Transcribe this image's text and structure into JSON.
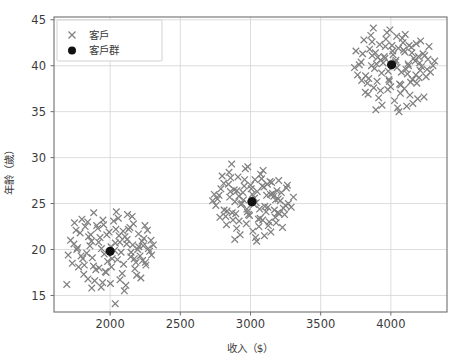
{
  "figure": {
    "background_color": "#ffffff",
    "plot_background_color": "#ffffff",
    "width": 459,
    "height": 364
  },
  "chart_data": {
    "type": "scatter",
    "title": "",
    "xlabel": "收入（$）",
    "ylabel": "年齡（歲）",
    "xlim": [
      1600,
      4400
    ],
    "ylim": [
      13.2,
      45.3
    ],
    "xticks": [
      2000,
      2500,
      3000,
      3500,
      4000
    ],
    "yticks": [
      15,
      20,
      25,
      30,
      35,
      40,
      45
    ],
    "xtick_labels": [
      "2000",
      "2500",
      "3000",
      "3500",
      "4000"
    ],
    "ytick_labels": [
      "15",
      "20",
      "25",
      "30",
      "35",
      "40",
      "45"
    ],
    "grid": true,
    "grid_color": "#d4d4d4",
    "legend_position": "upper left",
    "legend": [
      {
        "label": "客戶",
        "marker": "x",
        "color": "#808080"
      },
      {
        "label": "客戶群",
        "marker": "o",
        "color": "#111111"
      }
    ],
    "series": [
      {
        "name": "客戶",
        "marker": "x",
        "color": "#808080",
        "points": [
          [
            1742,
            20.6
          ],
          [
            1793,
            19.3
          ],
          [
            1846,
            21.4
          ],
          [
            1881,
            18.2
          ],
          [
            1904,
            22.6
          ],
          [
            1938,
            20.1
          ],
          [
            1966,
            17.6
          ],
          [
            1993,
            21.9
          ],
          [
            2014,
            19.0
          ],
          [
            2041,
            22.2
          ],
          [
            2069,
            20.8
          ],
          [
            2096,
            18.4
          ],
          [
            2121,
            21.1
          ],
          [
            2149,
            19.7
          ],
          [
            2176,
            17.9
          ],
          [
            2204,
            20.3
          ],
          [
            2231,
            18.8
          ],
          [
            1701,
            19.4
          ],
          [
            1757,
            22.1
          ],
          [
            1812,
            17.3
          ],
          [
            1867,
            20.9
          ],
          [
            1921,
            18.0
          ],
          [
            1976,
            21.6
          ],
          [
            2031,
            19.9
          ],
          [
            2086,
            17.4
          ],
          [
            2141,
            22.4
          ],
          [
            2196,
            20.0
          ],
          [
            2251,
            18.6
          ],
          [
            2281,
            19.8
          ],
          [
            2308,
            20.5
          ],
          [
            1840,
            23.0
          ],
          [
            1890,
            16.6
          ],
          [
            1949,
            23.2
          ],
          [
            2002,
            16.3
          ],
          [
            2058,
            23.4
          ],
          [
            2112,
            16.1
          ],
          [
            2166,
            22.8
          ],
          [
            2219,
            16.9
          ],
          [
            1775,
            18.1
          ],
          [
            1822,
            22.5
          ],
          [
            1873,
            19.1
          ],
          [
            1928,
            21.3
          ],
          [
            1982,
            18.7
          ],
          [
            2037,
            20.7
          ],
          [
            2092,
            22.0
          ],
          [
            2147,
            19.2
          ],
          [
            2202,
            21.7
          ],
          [
            2255,
            18.3
          ],
          [
            1718,
            21.0
          ],
          [
            1768,
            20.2
          ],
          [
            1856,
            20.4
          ],
          [
            1911,
            22.3
          ],
          [
            1958,
            19.5
          ],
          [
            2009,
            18.1
          ],
          [
            2063,
            21.5
          ],
          [
            2118,
            20.6
          ],
          [
            2172,
            19.0
          ],
          [
            2227,
            20.9
          ],
          [
            2266,
            22.1
          ],
          [
            2295,
            19.4
          ],
          [
            1883,
            24.0
          ],
          [
            1936,
            15.9
          ],
          [
            2044,
            24.1
          ],
          [
            2101,
            15.5
          ],
          [
            2157,
            23.6
          ],
          [
            1799,
            23.3
          ],
          [
            1842,
            16.8
          ],
          [
            2189,
            17.2
          ],
          [
            2240,
            21.2
          ],
          [
            2272,
            20.1
          ],
          [
            1730,
            18.5
          ],
          [
            1786,
            21.8
          ],
          [
            1833,
            19.6
          ],
          [
            1898,
            17.8
          ],
          [
            1953,
            22.7
          ],
          [
            2006,
            20.3
          ],
          [
            2052,
            18.9
          ],
          [
            2106,
            21.4
          ],
          [
            2161,
            20.5
          ],
          [
            2213,
            19.3
          ],
          [
            2248,
            22.6
          ],
          [
            1763,
            20.0
          ],
          [
            1816,
            18.3
          ],
          [
            1862,
            21.6
          ],
          [
            1918,
            20.8
          ],
          [
            1971,
            17.5
          ],
          [
            2025,
            23.1
          ],
          [
            2078,
            19.7
          ],
          [
            2131,
            22.2
          ],
          [
            2184,
            18.6
          ],
          [
            2236,
            20.4
          ],
          [
            1746,
            22.9
          ],
          [
            1805,
            19.0
          ],
          [
            1946,
            16.4
          ],
          [
            2070,
            16.7
          ],
          [
            2124,
            23.8
          ],
          [
            2291,
            21.0
          ],
          [
            1691,
            16.2
          ],
          [
            2036,
            14.1
          ],
          [
            1869,
            15.8
          ]
        ]
      },
      {
        "name": "客戶",
        "marker": "x",
        "color": "#808080",
        "points": [
          [
            2776,
            25.9
          ],
          [
            2812,
            24.3
          ],
          [
            2843,
            27.1
          ],
          [
            2875,
            23.2
          ],
          [
            2903,
            26.4
          ],
          [
            2931,
            24.9
          ],
          [
            2958,
            27.6
          ],
          [
            2986,
            23.8
          ],
          [
            3013,
            26.0
          ],
          [
            3041,
            25.1
          ],
          [
            3068,
            23.4
          ],
          [
            3096,
            26.8
          ],
          [
            3124,
            24.6
          ],
          [
            3151,
            27.3
          ],
          [
            3179,
            25.4
          ],
          [
            3206,
            23.9
          ],
          [
            2753,
            24.8
          ],
          [
            2789,
            26.6
          ],
          [
            2823,
            23.6
          ],
          [
            2858,
            27.8
          ],
          [
            2889,
            25.2
          ],
          [
            2919,
            23.1
          ],
          [
            2946,
            26.2
          ],
          [
            2974,
            24.4
          ],
          [
            3001,
            27.0
          ],
          [
            3029,
            25.6
          ],
          [
            3056,
            23.3
          ],
          [
            3084,
            26.9
          ],
          [
            3111,
            24.1
          ],
          [
            3139,
            27.4
          ],
          [
            3166,
            25.8
          ],
          [
            3194,
            24.0
          ],
          [
            2847,
            28.4
          ],
          [
            2901,
            22.3
          ],
          [
            2963,
            28.8
          ],
          [
            3017,
            22.0
          ],
          [
            3072,
            28.2
          ],
          [
            3127,
            22.6
          ],
          [
            2798,
            28.0
          ],
          [
            3183,
            22.9
          ],
          [
            2765,
            25.5
          ],
          [
            2833,
            24.2
          ],
          [
            2884,
            26.5
          ],
          [
            2939,
            25.0
          ],
          [
            2993,
            23.7
          ],
          [
            3048,
            26.3
          ],
          [
            3102,
            24.7
          ],
          [
            3157,
            26.1
          ],
          [
            3212,
            25.3
          ],
          [
            3234,
            24.5
          ],
          [
            2866,
            29.3
          ],
          [
            2926,
            21.6
          ],
          [
            2981,
            29.0
          ],
          [
            3036,
            21.3
          ],
          [
            3090,
            28.6
          ],
          [
            3145,
            21.9
          ],
          [
            2810,
            27.2
          ],
          [
            3201,
            27.5
          ],
          [
            3256,
            26.7
          ],
          [
            3270,
            25.0
          ],
          [
            2742,
            26.0
          ],
          [
            2782,
            23.5
          ],
          [
            2852,
            25.7
          ],
          [
            2911,
            27.9
          ],
          [
            2970,
            22.8
          ],
          [
            3024,
            24.9
          ],
          [
            3079,
            27.7
          ],
          [
            3133,
            23.0
          ],
          [
            3188,
            26.4
          ],
          [
            3243,
            23.8
          ],
          [
            2870,
            24.0
          ],
          [
            2950,
            25.4
          ],
          [
            3005,
            26.6
          ],
          [
            3060,
            22.5
          ],
          [
            3115,
            25.9
          ],
          [
            3170,
            24.3
          ],
          [
            2829,
            22.7
          ],
          [
            2895,
            23.9
          ],
          [
            2955,
            26.9
          ],
          [
            3010,
            25.2
          ],
          [
            3065,
            24.4
          ],
          [
            3120,
            27.1
          ],
          [
            3176,
            23.5
          ],
          [
            3220,
            26.2
          ],
          [
            3249,
            24.8
          ],
          [
            2888,
            21.1
          ],
          [
            3044,
            20.9
          ],
          [
            3099,
            21.5
          ],
          [
            2730,
            25.3
          ],
          [
            3290,
            24.6
          ],
          [
            2857,
            26.3
          ],
          [
            2917,
            25.8
          ],
          [
            2977,
            24.1
          ],
          [
            3032,
            27.6
          ],
          [
            3087,
            23.2
          ],
          [
            3142,
            26.0
          ],
          [
            3197,
            25.5
          ],
          [
            3228,
            22.4
          ],
          [
            3306,
            25.7
          ],
          [
            3263,
            27.0
          ]
        ]
      },
      {
        "name": "客戶",
        "marker": "x",
        "color": "#808080",
        "points": [
          [
            3788,
            40.4
          ],
          [
            3820,
            38.9
          ],
          [
            3849,
            41.8
          ],
          [
            3878,
            37.6
          ],
          [
            3906,
            40.9
          ],
          [
            3934,
            39.2
          ],
          [
            3961,
            42.1
          ],
          [
            3989,
            38.3
          ],
          [
            4016,
            41.2
          ],
          [
            4044,
            39.8
          ],
          [
            4071,
            37.9
          ],
          [
            4099,
            41.5
          ],
          [
            4126,
            40.0
          ],
          [
            4154,
            38.5
          ],
          [
            4181,
            42.4
          ],
          [
            4209,
            39.5
          ],
          [
            3763,
            39.0
          ],
          [
            3799,
            41.3
          ],
          [
            3833,
            38.1
          ],
          [
            3866,
            42.6
          ],
          [
            3897,
            40.2
          ],
          [
            3926,
            37.3
          ],
          [
            3953,
            41.0
          ],
          [
            3981,
            39.4
          ],
          [
            4008,
            42.2
          ],
          [
            4036,
            40.6
          ],
          [
            4063,
            38.0
          ],
          [
            4091,
            41.7
          ],
          [
            4118,
            39.1
          ],
          [
            4146,
            42.0
          ],
          [
            4173,
            40.5
          ],
          [
            4201,
            38.7
          ],
          [
            3857,
            43.3
          ],
          [
            3913,
            36.5
          ],
          [
            3972,
            43.6
          ],
          [
            4026,
            36.2
          ],
          [
            4081,
            43.0
          ],
          [
            4136,
            36.8
          ],
          [
            3808,
            42.8
          ],
          [
            4191,
            36.4
          ],
          [
            3775,
            40.1
          ],
          [
            3843,
            38.6
          ],
          [
            3890,
            41.4
          ],
          [
            3945,
            40.3
          ],
          [
            3999,
            37.7
          ],
          [
            4054,
            41.9
          ],
          [
            4108,
            39.6
          ],
          [
            4163,
            40.8
          ],
          [
            4218,
            39.9
          ],
          [
            4241,
            41.1
          ],
          [
            3875,
            44.1
          ],
          [
            3937,
            35.7
          ],
          [
            3993,
            43.9
          ],
          [
            4048,
            35.4
          ],
          [
            4102,
            43.4
          ],
          [
            4157,
            35.9
          ],
          [
            3818,
            37.1
          ],
          [
            4212,
            42.7
          ],
          [
            4264,
            40.7
          ],
          [
            4282,
            39.3
          ],
          [
            3751,
            41.6
          ],
          [
            3792,
            38.4
          ],
          [
            3862,
            40.0
          ],
          [
            3920,
            42.3
          ],
          [
            3978,
            37.4
          ],
          [
            4032,
            40.4
          ],
          [
            4087,
            42.5
          ],
          [
            4141,
            38.2
          ],
          [
            4196,
            41.0
          ],
          [
            4251,
            38.8
          ],
          [
            3884,
            39.7
          ],
          [
            3958,
            40.8
          ],
          [
            4013,
            41.6
          ],
          [
            4068,
            37.0
          ],
          [
            4123,
            40.2
          ],
          [
            4178,
            39.0
          ],
          [
            3838,
            36.9
          ],
          [
            3902,
            38.3
          ],
          [
            3965,
            42.9
          ],
          [
            4020,
            40.1
          ],
          [
            4075,
            39.3
          ],
          [
            4130,
            42.2
          ],
          [
            4185,
            38.1
          ],
          [
            4229,
            41.3
          ],
          [
            4258,
            39.6
          ],
          [
            3893,
            35.2
          ],
          [
            4058,
            35.0
          ],
          [
            4113,
            35.6
          ],
          [
            3741,
            39.8
          ],
          [
            4300,
            40.0
          ],
          [
            3867,
            41.1
          ],
          [
            3929,
            40.6
          ],
          [
            3986,
            38.5
          ],
          [
            4041,
            43.2
          ],
          [
            4096,
            37.5
          ],
          [
            4150,
            41.4
          ],
          [
            4205,
            40.3
          ],
          [
            4236,
            36.6
          ],
          [
            4312,
            40.5
          ],
          [
            4272,
            42.1
          ]
        ]
      },
      {
        "name": "客戶群",
        "marker": "o",
        "color": "#111111",
        "points": [
          [
            2000,
            19.8
          ],
          [
            3010,
            25.2
          ],
          [
            4005,
            40.1
          ]
        ]
      }
    ]
  }
}
